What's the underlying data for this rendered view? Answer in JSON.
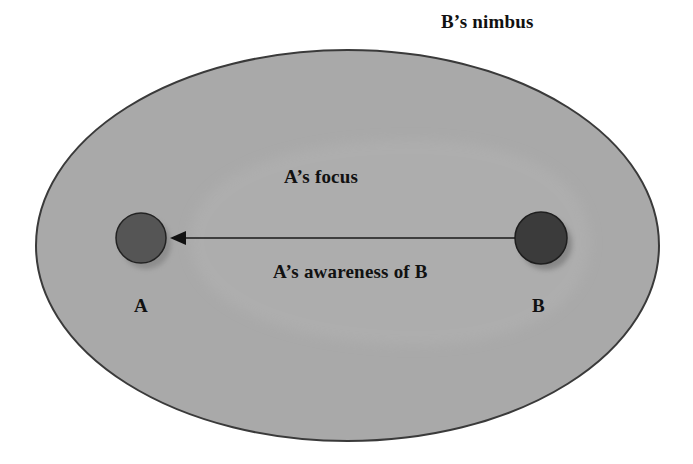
{
  "diagram": {
    "type": "awareness-model",
    "regions": {
      "nimbus": {
        "label": "B’s nimbus",
        "fill": "#a9a9a9",
        "stroke": "#3a3a3a"
      },
      "focus": {
        "label": "A’s focus",
        "fill": "#b1b1b1"
      }
    },
    "nodes": {
      "a": {
        "label": "A",
        "fill": "#555555",
        "stroke": "#222222"
      },
      "b": {
        "label": "B",
        "fill": "#3b3b3b",
        "stroke": "#1e1e1e"
      }
    },
    "edge": {
      "label": "A’s awareness of B",
      "from": "B",
      "to": "A",
      "color": "#1a1a1a"
    }
  }
}
